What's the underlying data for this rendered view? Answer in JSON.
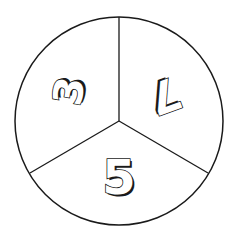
{
  "spinner": {
    "sections": [
      {
        "label": "3",
        "position": "upper-left",
        "rotation": -80
      },
      {
        "label": "7",
        "position": "upper-right",
        "rotation": 160
      },
      {
        "label": "5",
        "position": "bottom",
        "rotation": 0
      }
    ],
    "colors": {
      "outline": "#1a1a1a",
      "fill": "#ffffff"
    }
  }
}
